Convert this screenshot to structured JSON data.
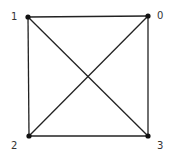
{
  "diagram": {
    "type": "graph",
    "nodes": [
      {
        "id": "0",
        "label": "0"
      },
      {
        "id": "1",
        "label": "1"
      },
      {
        "id": "2",
        "label": "2"
      },
      {
        "id": "3",
        "label": "3"
      }
    ],
    "edges": [
      {
        "from": "1",
        "to": "0"
      },
      {
        "from": "0",
        "to": "3"
      },
      {
        "from": "3",
        "to": "2"
      },
      {
        "from": "2",
        "to": "1"
      },
      {
        "from": "1",
        "to": "3"
      },
      {
        "from": "0",
        "to": "2"
      }
    ],
    "colors": {
      "edge": "#222222",
      "node": "#111111",
      "label": "#333333"
    }
  }
}
